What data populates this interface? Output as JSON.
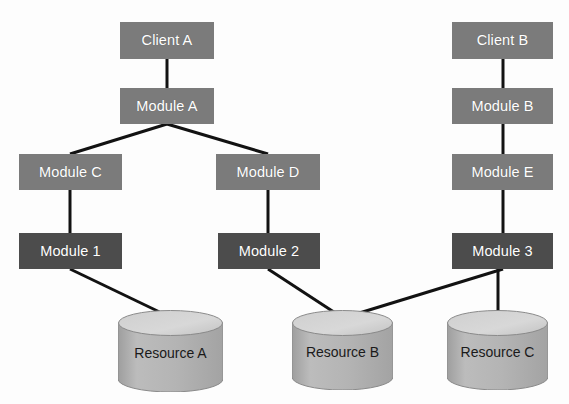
{
  "diagram": {
    "type": "node-link-diagram",
    "canvas": {
      "width": 569,
      "height": 404,
      "background": "#fdfdfd"
    },
    "colors": {
      "client_module_fill": "#7b7b7b",
      "leaf_module_fill": "#4c4c4c",
      "cylinder_body_fill": "#b0b0b0",
      "cylinder_top_fill": "#d2d2d2",
      "cylinder_stroke": "#8a8a8a",
      "edge_stroke": "#121212",
      "box_label_color": "#ffffff",
      "cylinder_label_color": "#1a1a1a"
    },
    "nodes": [
      {
        "id": "client_a",
        "label": "Client A",
        "shape": "rect",
        "style": "light",
        "x": 120,
        "y": 22,
        "w": 94,
        "h": 37
      },
      {
        "id": "module_a",
        "label": "Module A",
        "shape": "rect",
        "style": "light",
        "x": 120,
        "y": 88,
        "w": 94,
        "h": 36
      },
      {
        "id": "module_c",
        "label": "Module C",
        "shape": "rect",
        "style": "light",
        "x": 19,
        "y": 154,
        "w": 103,
        "h": 36
      },
      {
        "id": "module_d",
        "label": "Module D",
        "shape": "rect",
        "style": "light",
        "x": 216,
        "y": 154,
        "w": 104,
        "h": 36
      },
      {
        "id": "module_1",
        "label": "Module 1",
        "shape": "rect",
        "style": "dark",
        "x": 19,
        "y": 233,
        "w": 103,
        "h": 36
      },
      {
        "id": "module_2",
        "label": "Module 2",
        "shape": "rect",
        "style": "dark",
        "x": 218,
        "y": 233,
        "w": 102,
        "h": 36
      },
      {
        "id": "client_b",
        "label": "Client B",
        "shape": "rect",
        "style": "light",
        "x": 452,
        "y": 22,
        "w": 101,
        "h": 37
      },
      {
        "id": "module_b",
        "label": "Module B",
        "shape": "rect",
        "style": "light",
        "x": 452,
        "y": 88,
        "w": 101,
        "h": 36
      },
      {
        "id": "module_e",
        "label": "Module E",
        "shape": "rect",
        "style": "light",
        "x": 452,
        "y": 154,
        "w": 101,
        "h": 36
      },
      {
        "id": "module_3",
        "label": "Module 3",
        "shape": "rect",
        "style": "dark",
        "x": 452,
        "y": 233,
        "w": 101,
        "h": 36
      },
      {
        "id": "resource_a",
        "label": "Resource A",
        "shape": "cylinder",
        "x": 118,
        "y": 310,
        "w": 105,
        "h": 82
      },
      {
        "id": "resource_b",
        "label": "Resource B",
        "shape": "cylinder",
        "x": 292,
        "y": 310,
        "w": 101,
        "h": 80
      },
      {
        "id": "resource_c",
        "label": "Resource C",
        "shape": "cylinder",
        "x": 447,
        "y": 310,
        "w": 101,
        "h": 80
      }
    ],
    "edges": [
      {
        "id": "e1",
        "from": "client_a",
        "to": "module_a",
        "x1": 167,
        "y1": 59,
        "x2": 167,
        "y2": 88
      },
      {
        "id": "e2",
        "from": "module_a",
        "to": "module_c",
        "x1": 167,
        "y1": 124,
        "x2": 70,
        "y2": 154
      },
      {
        "id": "e3",
        "from": "module_a",
        "to": "module_d",
        "x1": 167,
        "y1": 124,
        "x2": 268,
        "y2": 154
      },
      {
        "id": "e4",
        "from": "module_c",
        "to": "module_1",
        "x1": 70,
        "y1": 190,
        "x2": 70,
        "y2": 233
      },
      {
        "id": "e5",
        "from": "module_d",
        "to": "module_2",
        "x1": 268,
        "y1": 190,
        "x2": 268,
        "y2": 233
      },
      {
        "id": "e6",
        "from": "module_1",
        "to": "resource_a",
        "x1": 70,
        "y1": 269,
        "x2": 170,
        "y2": 317
      },
      {
        "id": "e7",
        "from": "module_2",
        "to": "resource_b",
        "x1": 268,
        "y1": 269,
        "x2": 343,
        "y2": 318
      },
      {
        "id": "e8",
        "from": "client_b",
        "to": "module_b",
        "x1": 503,
        "y1": 59,
        "x2": 503,
        "y2": 88
      },
      {
        "id": "e9",
        "from": "module_b",
        "to": "module_e",
        "x1": 503,
        "y1": 124,
        "x2": 503,
        "y2": 154
      },
      {
        "id": "e10",
        "from": "module_e",
        "to": "module_3",
        "x1": 503,
        "y1": 190,
        "x2": 503,
        "y2": 233
      },
      {
        "id": "e11",
        "from": "module_3",
        "to": "resource_b",
        "x1": 503,
        "y1": 269,
        "x2": 343,
        "y2": 318
      },
      {
        "id": "e12",
        "from": "module_3",
        "to": "resource_c",
        "x1": 498,
        "y1": 269,
        "x2": 498,
        "y2": 317
      }
    ]
  }
}
